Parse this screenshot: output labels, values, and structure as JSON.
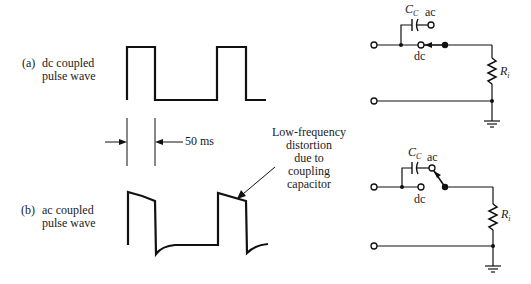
{
  "panel_a": {
    "tag": "(a)",
    "label_line1": "dc coupled",
    "label_line2": "pulse wave"
  },
  "panel_b": {
    "tag": "(b)",
    "label_line1": "ac coupled",
    "label_line2": "pulse wave"
  },
  "dimension": {
    "label": "50 ms"
  },
  "annotation": {
    "lines": [
      "Low-frequency",
      "distortion",
      "due to",
      "coupling",
      "capacitor"
    ]
  },
  "circuit_a": {
    "capacitor_label": "C",
    "capacitor_subscript": "C",
    "switch_ac_label": "ac",
    "switch_dc_label": "dc",
    "switch_position": "dc",
    "resistor_label": "R",
    "resistor_subscript": "i"
  },
  "circuit_b": {
    "capacitor_label": "C",
    "capacitor_subscript": "C",
    "switch_ac_label": "ac",
    "switch_dc_label": "dc",
    "switch_position": "ac",
    "resistor_label": "R",
    "resistor_subscript": "i"
  }
}
